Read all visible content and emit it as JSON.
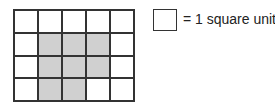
{
  "figure": {
    "grid": {
      "columns": 5,
      "rows": 4,
      "shaded_cells": [
        [
          1,
          1
        ],
        [
          1,
          2
        ],
        [
          1,
          3
        ],
        [
          2,
          1
        ],
        [
          2,
          2
        ],
        [
          2,
          3
        ],
        [
          3,
          1
        ],
        [
          3,
          2
        ]
      ],
      "shaded_color": "#d0d0d0",
      "line_color": "#333333"
    },
    "legend": {
      "label": "= 1 square unit"
    }
  }
}
